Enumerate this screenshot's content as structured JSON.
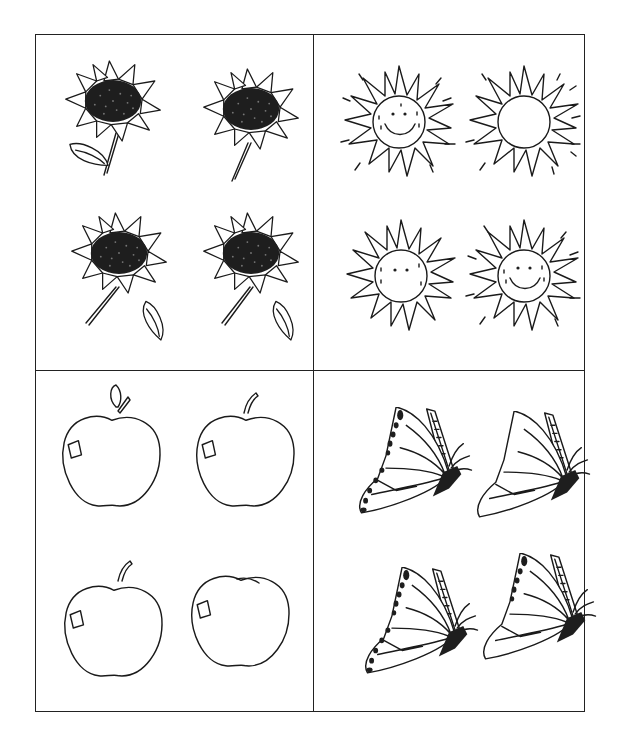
{
  "worksheet": {
    "type": "spot-the-difference picture grid",
    "background_color": "#ffffff",
    "line_color": "#1a1a1a",
    "quadrants": [
      {
        "id": "sunflowers",
        "subject": "sunflower",
        "items": [
          {
            "position": "top-left",
            "has_leaf": true,
            "leaf_side": "left",
            "stem": true
          },
          {
            "position": "top-right",
            "has_leaf": false,
            "stem": true
          },
          {
            "position": "bottom-left",
            "has_leaf": true,
            "leaf_side": "right",
            "stem": true
          },
          {
            "position": "bottom-right",
            "has_leaf": true,
            "leaf_side": "right",
            "stem": true
          }
        ]
      },
      {
        "id": "suns",
        "subject": "sun",
        "items": [
          {
            "position": "top-left",
            "face": "smiling",
            "eyes": true,
            "mouth": true,
            "freckles": true,
            "sparkle_lines": true
          },
          {
            "position": "top-right",
            "face": "blank",
            "eyes": false,
            "mouth": false,
            "freckles": false,
            "sparkle_lines": true
          },
          {
            "position": "bottom-left",
            "face": "no-mouth",
            "eyes": true,
            "mouth": false,
            "freckles": true,
            "sparkle_lines": false
          },
          {
            "position": "bottom-right",
            "face": "smiling",
            "eyes": true,
            "mouth": true,
            "freckles": true,
            "sparkle_lines": true
          }
        ]
      },
      {
        "id": "apples",
        "subject": "apple",
        "items": [
          {
            "position": "top-left",
            "stem": true,
            "leaf": true,
            "highlight": true
          },
          {
            "position": "top-right",
            "stem": true,
            "leaf": false,
            "highlight": true
          },
          {
            "position": "bottom-left",
            "stem": true,
            "leaf": false,
            "highlight": true
          },
          {
            "position": "bottom-right",
            "stem": false,
            "leaf": false,
            "highlight": true
          }
        ]
      },
      {
        "id": "butterflies",
        "subject": "butterfly",
        "items": [
          {
            "position": "top-left",
            "wing_spots": true,
            "antennae": true
          },
          {
            "position": "top-right",
            "wing_spots": false,
            "antennae": true
          },
          {
            "position": "bottom-left",
            "wing_spots": true,
            "antennae": true
          },
          {
            "position": "bottom-right",
            "wing_spots": "top-only",
            "antennae": true
          }
        ]
      }
    ]
  }
}
